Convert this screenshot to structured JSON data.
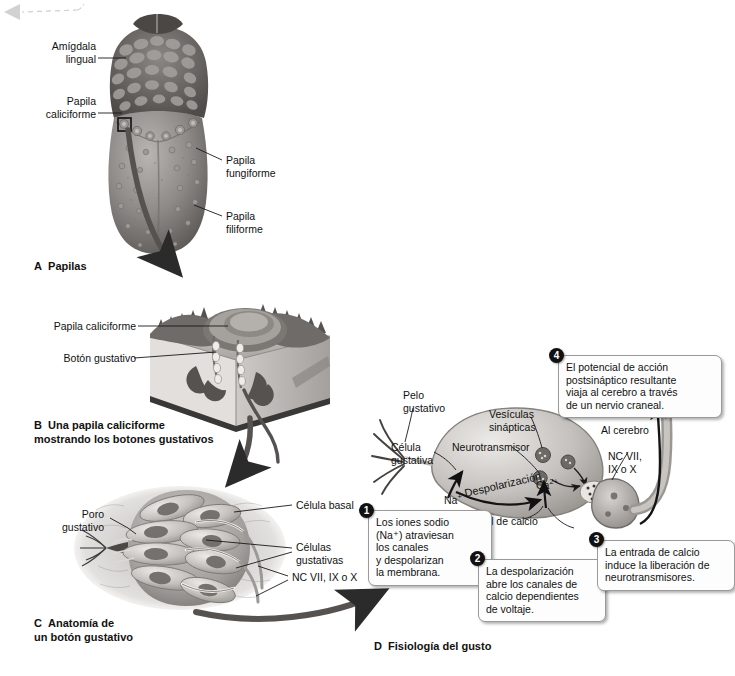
{
  "figure": {
    "language": "es",
    "palette": {
      "ink": "#111111",
      "panel_bg": "#e3e3e3",
      "callout_bg": "#fdfdfd",
      "callout_border": "#9a9a9a",
      "badge": "#111111"
    }
  },
  "panels": [
    {
      "id": "A",
      "letter": "A",
      "caption": "Papilas"
    },
    {
      "id": "B",
      "letter": "B",
      "caption": "Una papila caliciforme\nmostrando los botones gustativos"
    },
    {
      "id": "C",
      "letter": "C",
      "caption": "Anatomía de\nun botón gustativo"
    },
    {
      "id": "D",
      "letter": "D",
      "caption": "Fisiología del gusto"
    }
  ],
  "panel_a": {
    "labels": [
      {
        "name": "amigdala-lingual",
        "text": "Amígdala\nlingual",
        "align": "right"
      },
      {
        "name": "papila-caliciforme",
        "text": "Papila\ncaliciforme",
        "align": "right"
      },
      {
        "name": "papila-fungiforme",
        "text": "Papila\nfungiforme",
        "align": "left"
      },
      {
        "name": "papila-filiforme",
        "text": "Papila\nfiliforme",
        "align": "left"
      }
    ]
  },
  "panel_b": {
    "labels": [
      {
        "name": "papila-caliciforme",
        "text": "Papila caliciforme"
      },
      {
        "name": "boton-gustativo",
        "text": "Botón gustativo"
      }
    ]
  },
  "panel_c": {
    "labels": [
      {
        "name": "poro-gustativo",
        "text": "Poro\ngustativo",
        "align": "right"
      },
      {
        "name": "celula-basal",
        "text": "Célula basal",
        "align": "left"
      },
      {
        "name": "celulas-gustativas",
        "text": "Células\ngustativas",
        "align": "left"
      },
      {
        "name": "nervios-craneales",
        "text": "NC VII, IX o X",
        "align": "left"
      }
    ]
  },
  "panel_d": {
    "labels": [
      {
        "name": "pelo-gustativo",
        "text": "Pelo\ngustativo"
      },
      {
        "name": "celula-gustativa",
        "text": "Célula\ngustativa"
      },
      {
        "name": "vesiculas-sinapticas",
        "text": "Vesículas\nsinápticas"
      },
      {
        "name": "neurotransmisor",
        "text": "Neurotransmisor"
      },
      {
        "name": "al-cerebro",
        "text": "Al cerebro"
      },
      {
        "name": "nervios-craneales",
        "text": "NC VII,\nIX o X"
      },
      {
        "name": "canal-de-calcio",
        "text": "Canal de calcio"
      },
      {
        "name": "despolarizacion",
        "text": "Despolarización"
      }
    ],
    "ions": [
      {
        "name": "sodium-ion",
        "symbol": "Na",
        "charge": "+"
      },
      {
        "name": "calcium-ion",
        "symbol": "Ca",
        "charge": "2+"
      }
    ],
    "steps": [
      {
        "number": "1",
        "text": "Los iones sodio\n(Na⁺) atraviesan\nlos canales\ny despolarizan\nla membrana."
      },
      {
        "number": "2",
        "text": "La despolarización\nabre los canales de\ncalcio dependientes\nde voltaje."
      },
      {
        "number": "3",
        "text": "La entrada de calcio\ninduce la liberación de\nneurotransmisores."
      },
      {
        "number": "4",
        "text": "El potencial de acción\npostsináptico resultante\nviaja al cerebro a través\nde un nervio craneal."
      }
    ]
  }
}
